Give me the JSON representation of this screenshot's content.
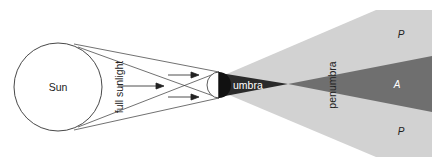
{
  "diagram": {
    "labels": {
      "sun": "Sun",
      "full_sunlight": "full sunlight",
      "umbra": "umbra",
      "penumbra": "penumbra",
      "penumbra_top": "P",
      "antumbra": "A",
      "penumbra_bottom": "P"
    },
    "colors": {
      "background": "#ffffff",
      "line": "#333333",
      "penumbra": "#d2d2d2",
      "antumbra": "#6f6f6f",
      "umbra": "#2a2a2a",
      "moon_dark": "#111111",
      "umbra_text": "#ffffff",
      "antumbra_text": "#ffffff",
      "text": "#222222"
    }
  }
}
